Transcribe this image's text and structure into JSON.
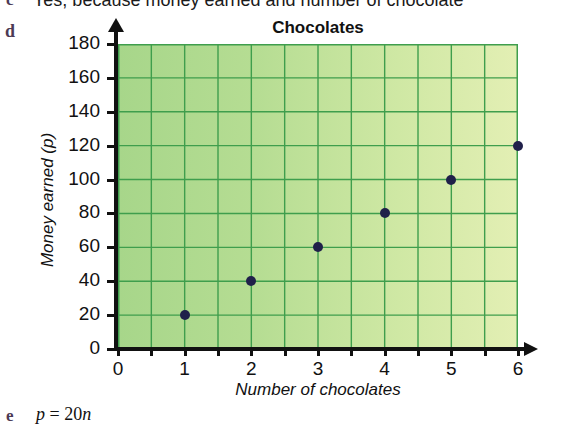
{
  "worksheet": {
    "item_c": {
      "marker": "c",
      "text": "Yes, because money earned and number of chocolate"
    },
    "item_d": {
      "marker": "d"
    },
    "item_e": {
      "marker": "e",
      "equation_prefix": "p",
      "equation_middle": " = 20",
      "equation_suffix": "n",
      "equation_full": "p = 20n"
    }
  },
  "chart_data": {
    "type": "scatter",
    "title": "Chocolates",
    "xlabel": "Number of chocolates",
    "ylabel": "Money earned (p)",
    "x": [
      1,
      2,
      3,
      4,
      5,
      6
    ],
    "values": [
      20,
      40,
      60,
      80,
      100,
      120
    ],
    "points": [
      {
        "x": 1,
        "y": 20
      },
      {
        "x": 2,
        "y": 40
      },
      {
        "x": 3,
        "y": 60
      },
      {
        "x": 4,
        "y": 80
      },
      {
        "x": 5,
        "y": 100
      },
      {
        "x": 6,
        "y": 120
      }
    ],
    "xlim": [
      0,
      6
    ],
    "ylim": [
      0,
      180
    ],
    "xticks": [
      0,
      1,
      2,
      3,
      4,
      5,
      6
    ],
    "yticks": [
      0,
      20,
      40,
      60,
      80,
      100,
      120,
      140,
      160,
      180
    ],
    "xtick_labels": [
      "0",
      "1",
      "2",
      "3",
      "4",
      "5",
      "6"
    ],
    "ytick_labels": [
      "0",
      "20",
      "40",
      "60",
      "80",
      "100",
      "120",
      "140",
      "160",
      "180"
    ],
    "grid": true,
    "grid_x_step": 0.5,
    "grid_y_step": 20,
    "legend": null,
    "marker_color": "#20204a",
    "grid_color": "#3f9e4d",
    "plot_bg_left": "#a7d68a",
    "plot_bg_right": "#e3efb4",
    "axis_color": "#111111"
  }
}
